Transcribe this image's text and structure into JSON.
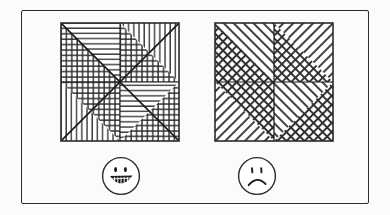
{
  "figure": {
    "background_color": "#fbfbf9",
    "ink_color": "#2b2b2b",
    "frame": {
      "label": "outer-border",
      "style": "hand-drawn rectangle",
      "x": 21,
      "y": 10,
      "width": 348,
      "height": 194
    },
    "panels": [
      {
        "id": "left-panel",
        "label": "Easy discrimination patch",
        "square": {
          "x": 60,
          "y": 22,
          "width": 118,
          "height": 118,
          "divisions": "quadrants split by both diagonals into eight triangles",
          "hatch_family": "orthogonal",
          "triangles": [
            {
              "quadrant": "top-left",
              "part": "upper-right",
              "pattern": "horizontal-lines"
            },
            {
              "quadrant": "top-left",
              "part": "lower-left",
              "pattern": "cross-hatch-grid"
            },
            {
              "quadrant": "top-right",
              "part": "upper-left",
              "pattern": "cross-hatch-grid"
            },
            {
              "quadrant": "top-right",
              "part": "lower-right",
              "pattern": "vertical-lines"
            },
            {
              "quadrant": "bottom-left",
              "part": "upper-left",
              "pattern": "vertical-lines"
            },
            {
              "quadrant": "bottom-left",
              "part": "lower-right",
              "pattern": "cross-hatch-grid"
            },
            {
              "quadrant": "bottom-right",
              "part": "upper-left",
              "pattern": "horizontal-lines"
            },
            {
              "quadrant": "bottom-right",
              "part": "lower-right",
              "pattern": "cross-hatch-grid"
            }
          ]
        },
        "face": {
          "type": "happy-face",
          "expression": "smiling",
          "cx": 121,
          "cy": 176,
          "r": 20,
          "eyes": "two short vertical dashes",
          "mouth": "wide open grin with teeth"
        }
      },
      {
        "id": "right-panel",
        "label": "Hard discrimination patch",
        "square": {
          "x": 214,
          "y": 22,
          "width": 118,
          "height": 118,
          "divisions": "quadrants split by both diagonals into eight triangles",
          "hatch_family": "diagonal",
          "triangles": [
            {
              "quadrant": "top-left",
              "part": "upper-right",
              "pattern": "diagonal-slash-lines"
            },
            {
              "quadrant": "top-left",
              "part": "lower-left",
              "pattern": "diagonal-cross-hatch"
            },
            {
              "quadrant": "top-right",
              "part": "upper-left",
              "pattern": "diagonal-cross-hatch"
            },
            {
              "quadrant": "top-right",
              "part": "lower-right",
              "pattern": "diagonal-backslash-lines"
            },
            {
              "quadrant": "bottom-left",
              "part": "upper-left",
              "pattern": "diagonal-backslash-lines"
            },
            {
              "quadrant": "bottom-left",
              "part": "lower-right",
              "pattern": "diagonal-cross-hatch"
            },
            {
              "quadrant": "bottom-right",
              "part": "upper-left",
              "pattern": "diagonal-slash-lines"
            },
            {
              "quadrant": "bottom-right",
              "part": "lower-right",
              "pattern": "diagonal-cross-hatch"
            }
          ]
        },
        "face": {
          "type": "sad-face",
          "expression": "frowning",
          "cx": 262,
          "cy": 176,
          "r": 20,
          "eyes": "two short vertical dashes",
          "mouth": "downturned arc"
        }
      }
    ]
  }
}
